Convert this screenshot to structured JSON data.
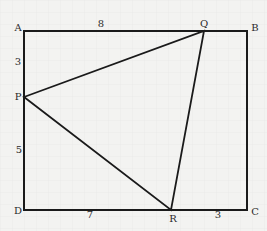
{
  "diagram": {
    "type": "geometry",
    "points": {
      "A": {
        "label": "A",
        "x": 24,
        "y": 31
      },
      "B": {
        "label": "B",
        "x": 247,
        "y": 31
      },
      "C": {
        "label": "C",
        "x": 247,
        "y": 210
      },
      "D": {
        "label": "D",
        "x": 24,
        "y": 210
      },
      "P": {
        "label": "P",
        "x": 24,
        "y": 97
      },
      "Q": {
        "label": "Q",
        "x": 204,
        "y": 31
      },
      "R": {
        "label": "R",
        "x": 171,
        "y": 210
      }
    },
    "measurements": {
      "AQ": "8",
      "AP": "3",
      "PD": "5",
      "DR": "7",
      "RC": "3"
    },
    "colors": {
      "line": "#1a1a1a",
      "background": "#f3f3f1",
      "grid": "#e2e2e0"
    }
  }
}
